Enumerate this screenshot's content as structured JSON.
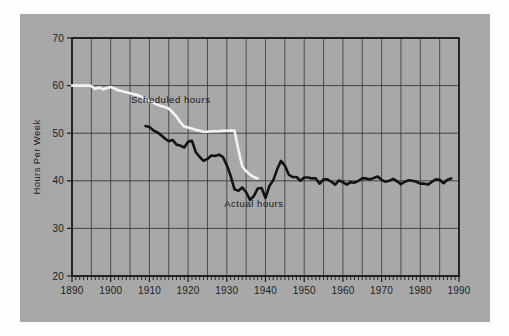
{
  "figure": {
    "panel_bg": "#a8a8a8",
    "page_bg": "#fdfdfd",
    "frame_color": "#1c1c1c",
    "grid_color": "#3a3a38"
  },
  "chart_data": {
    "type": "line",
    "title": "",
    "xlabel": "",
    "ylabel": "Hours Per Week",
    "xlim": [
      1890,
      1990
    ],
    "ylim": [
      20,
      70
    ],
    "ytick_values": [
      20,
      30,
      40,
      50,
      60,
      70
    ],
    "ytick_labels": [
      "20",
      "30",
      "40",
      "50",
      "60",
      "70"
    ],
    "xtick_values": [
      1890,
      1900,
      1910,
      1920,
      1930,
      1940,
      1950,
      1960,
      1970,
      1980,
      1990
    ],
    "xtick_labels": [
      "1890",
      "1900",
      "1910",
      "1920",
      "1930",
      "1940",
      "1950",
      "1960",
      "1970",
      "1980",
      "1990"
    ],
    "x_minor_tick_step": 1,
    "grid": "major gridlines: horizontal every 10 units, vertical every 5 years",
    "x_gridline_step": 5,
    "y_gridline_step": 10,
    "legend": "inline annotations on plot",
    "annotations": [
      {
        "text": "Scheduled hours",
        "x": 1915.5,
        "y": 56.3,
        "color": "#17171a"
      },
      {
        "text": "Actual hours",
        "x": 1937.0,
        "y": 34.6,
        "color": "#17171a"
      }
    ],
    "series": [
      {
        "name": "Scheduled hours",
        "color": "#f5f3ef",
        "linewidth": 2.6,
        "x": [
          1890,
          1892,
          1894,
          1895,
          1896,
          1897,
          1898,
          1899,
          1900,
          1901,
          1902,
          1903,
          1904,
          1905,
          1906,
          1907,
          1908,
          1909,
          1910,
          1911,
          1912,
          1913,
          1914,
          1915,
          1916,
          1917,
          1918,
          1919,
          1920,
          1921,
          1922,
          1923,
          1924,
          1925,
          1926,
          1927,
          1928,
          1929,
          1930,
          1931,
          1932,
          1933,
          1934,
          1935,
          1936,
          1937,
          1938
        ],
        "y": [
          60.0,
          60.0,
          60.0,
          59.9,
          59.3,
          59.6,
          59.2,
          59.5,
          59.7,
          59.4,
          59.0,
          58.8,
          58.6,
          58.4,
          58.2,
          58.0,
          57.6,
          57.2,
          56.8,
          56.4,
          56.0,
          55.7,
          55.5,
          55.2,
          54.4,
          53.5,
          52.3,
          51.4,
          51.2,
          51.0,
          50.7,
          50.5,
          50.3,
          50.3,
          50.4,
          50.4,
          50.4,
          50.5,
          50.5,
          50.6,
          50.5,
          46.5,
          43.0,
          42.0,
          41.3,
          40.8,
          40.5
        ]
      },
      {
        "name": "Actual hours",
        "color": "#131313",
        "linewidth": 2.6,
        "x": [
          1909,
          1910,
          1911,
          1912,
          1913,
          1914,
          1915,
          1916,
          1917,
          1918,
          1919,
          1920,
          1921,
          1922,
          1923,
          1924,
          1925,
          1926,
          1927,
          1928,
          1929,
          1930,
          1931,
          1932,
          1933,
          1934,
          1935,
          1936,
          1937,
          1938,
          1939,
          1940,
          1941,
          1942,
          1943,
          1944,
          1945,
          1946,
          1947,
          1948,
          1949,
          1950,
          1951,
          1952,
          1953,
          1954,
          1955,
          1956,
          1957,
          1958,
          1959,
          1960,
          1961,
          1962,
          1963,
          1964,
          1965,
          1966,
          1967,
          1968,
          1969,
          1970,
          1971,
          1972,
          1973,
          1974,
          1975,
          1976,
          1977,
          1978,
          1979,
          1980,
          1981,
          1982,
          1983,
          1984,
          1985,
          1986,
          1987,
          1988
        ],
        "y": [
          51.5,
          51.3,
          50.6,
          50.2,
          49.6,
          48.9,
          48.3,
          48.6,
          47.6,
          47.4,
          47.0,
          48.2,
          48.4,
          46.0,
          45.0,
          44.2,
          44.6,
          45.3,
          45.2,
          45.5,
          45.0,
          43.3,
          41.0,
          38.2,
          37.9,
          38.6,
          37.6,
          36.0,
          36.8,
          38.4,
          38.5,
          36.4,
          38.9,
          40.1,
          42.4,
          44.2,
          43.2,
          41.3,
          40.8,
          40.8,
          40.0,
          40.7,
          40.7,
          40.5,
          40.5,
          39.4,
          40.3,
          40.3,
          39.8,
          39.2,
          40.1,
          39.7,
          39.2,
          39.7,
          39.6,
          40.0,
          40.5,
          40.5,
          40.3,
          40.6,
          40.9,
          40.2,
          39.8,
          40.0,
          40.4,
          39.9,
          39.3,
          39.8,
          40.1,
          40.0,
          39.8,
          39.4,
          39.4,
          39.2,
          39.8,
          40.3,
          40.2,
          39.5,
          40.2,
          40.5
        ]
      }
    ]
  }
}
